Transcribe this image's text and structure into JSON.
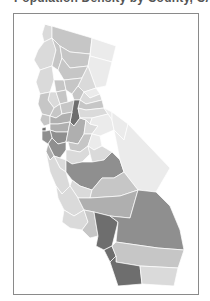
{
  "title": "Population Density by County, CA",
  "map": {
    "region": "California",
    "style": "grayscale choropleth",
    "colors": {
      "frame_border": "#8a8a8a",
      "background": "#ffffff",
      "level_1": "#ebebeb",
      "level_2": "#dadada",
      "level_3": "#c6c6c6",
      "level_4": "#afafaf",
      "level_5": "#8f8f8f",
      "level_6": "#6e6e6e"
    },
    "counties": [
      {
        "name": "Del Norte",
        "level": 2
      },
      {
        "name": "Siskiyou",
        "level": 3
      },
      {
        "name": "Modoc",
        "level": 1
      },
      {
        "name": "Humboldt",
        "level": 2
      },
      {
        "name": "Trinity",
        "level": 3
      },
      {
        "name": "Shasta",
        "level": 3
      },
      {
        "name": "Lassen",
        "level": 1
      },
      {
        "name": "Mendocino",
        "level": 2
      },
      {
        "name": "Tehama",
        "level": 3
      },
      {
        "name": "Plumas",
        "level": 2
      },
      {
        "name": "Glenn",
        "level": 3
      },
      {
        "name": "Butte",
        "level": 3
      },
      {
        "name": "Sierra",
        "level": 1
      },
      {
        "name": "Lake",
        "level": 2
      },
      {
        "name": "Colusa",
        "level": 3
      },
      {
        "name": "Yuba",
        "level": 3
      },
      {
        "name": "Nevada",
        "level": 2
      },
      {
        "name": "Placer",
        "level": 3
      },
      {
        "name": "Sonoma",
        "level": 3
      },
      {
        "name": "Napa",
        "level": 3
      },
      {
        "name": "Yolo",
        "level": 3
      },
      {
        "name": "Sacramento",
        "level": 5
      },
      {
        "name": "El Dorado",
        "level": 2
      },
      {
        "name": "Alpine",
        "level": 1
      },
      {
        "name": "Marin",
        "level": 3
      },
      {
        "name": "Solano",
        "level": 4
      },
      {
        "name": "San Francisco",
        "level": 6
      },
      {
        "name": "Contra Costa",
        "level": 4
      },
      {
        "name": "Alameda",
        "level": 5
      },
      {
        "name": "San Joaquin",
        "level": 4
      },
      {
        "name": "Amador",
        "level": 2
      },
      {
        "name": "Calaveras",
        "level": 2
      },
      {
        "name": "Tuolumne",
        "level": 1
      },
      {
        "name": "Mono",
        "level": 1
      },
      {
        "name": "San Mateo",
        "level": 5
      },
      {
        "name": "Santa Clara",
        "level": 5
      },
      {
        "name": "Stanislaus",
        "level": 3
      },
      {
        "name": "Mariposa",
        "level": 1
      },
      {
        "name": "Santa Cruz",
        "level": 4
      },
      {
        "name": "Merced",
        "level": 2
      },
      {
        "name": "Madera",
        "level": 2
      },
      {
        "name": "San Benito",
        "level": 2
      },
      {
        "name": "Monterey",
        "level": 2
      },
      {
        "name": "Fresno",
        "level": 5
      },
      {
        "name": "Inyo",
        "level": 1
      },
      {
        "name": "Kings",
        "level": 2
      },
      {
        "name": "Tulare",
        "level": 3
      },
      {
        "name": "San Luis Obispo",
        "level": 2
      },
      {
        "name": "Kern",
        "level": 4
      },
      {
        "name": "Santa Barbara",
        "level": 2
      },
      {
        "name": "Ventura",
        "level": 3
      },
      {
        "name": "Los Angeles",
        "level": 6
      },
      {
        "name": "San Bernardino",
        "level": 5
      },
      {
        "name": "Orange",
        "level": 6
      },
      {
        "name": "Riverside",
        "level": 4
      },
      {
        "name": "San Diego",
        "level": 6
      },
      {
        "name": "Imperial",
        "level": 3
      }
    ]
  }
}
